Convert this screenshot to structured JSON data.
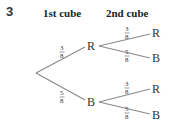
{
  "question_number": "3",
  "headers": {
    "first": "1st cube",
    "second": "2nd cube"
  },
  "tree": {
    "level1": [
      {
        "outcome": "R",
        "probability": {
          "num": "3",
          "den": "8"
        }
      },
      {
        "outcome": "B",
        "probability": {
          "num": "5",
          "den": "8"
        }
      }
    ],
    "level2": {
      "after_R": [
        {
          "outcome": "R",
          "probability": {
            "num": "3",
            "den": "8"
          }
        },
        {
          "outcome": "B",
          "probability": {
            "num": "5",
            "den": "8"
          }
        }
      ],
      "after_B": [
        {
          "outcome": "R",
          "probability": {
            "num": "3",
            "den": "8"
          }
        },
        {
          "outcome": "B",
          "probability": {
            "num": "5",
            "den": "8"
          }
        }
      ]
    }
  },
  "colors": {
    "line": "#8a8a8a",
    "text": "#333333"
  }
}
